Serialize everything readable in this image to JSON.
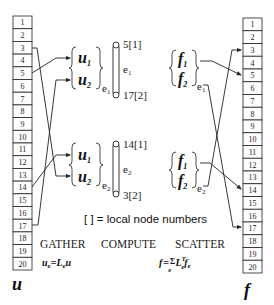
{
  "left_array": {
    "label": "u",
    "cells": [
      "1",
      "2",
      "3",
      "4",
      "5",
      "6",
      "7",
      "8",
      "9",
      "10",
      "11",
      "12",
      "13",
      "14",
      "15",
      "16",
      "17",
      "18",
      "19",
      "20"
    ]
  },
  "right_array": {
    "label": "f",
    "cells": [
      "1",
      "2",
      "3",
      "4",
      "5",
      "6",
      "7",
      "8",
      "9",
      "10",
      "11",
      "12",
      "13",
      "14",
      "15",
      "16",
      "17",
      "18",
      "19",
      "20"
    ]
  },
  "element_1": {
    "name": "e1",
    "name_main": "e",
    "name_sub": "1",
    "u_vector": {
      "u1_main": "u",
      "u1_sub": "1",
      "u2_main": "u",
      "u2_sub": "2",
      "elem_main": "e",
      "elem_sub": "1"
    },
    "f_vector": {
      "f1_main": "f",
      "f1_sub": "1",
      "f2_main": "f",
      "f2_sub": "2",
      "elem_main": "e",
      "elem_sub": "1"
    },
    "node_top": "5[1]",
    "node_bottom": "17[2]",
    "gather_map": {
      "u1": 5,
      "u2": 17
    },
    "scatter_map": {
      "f1": 5,
      "f2": 17
    }
  },
  "element_2": {
    "name": "e2",
    "name_main": "e",
    "name_sub": "2",
    "u_vector": {
      "u1_main": "u",
      "u1_sub": "1",
      "u2_main": "u",
      "u2_sub": "2",
      "elem_main": "e",
      "elem_sub": "2"
    },
    "f_vector": {
      "f1_main": "f",
      "f1_sub": "1",
      "f2_main": "f",
      "f2_sub": "2",
      "elem_main": "e",
      "elem_sub": "2"
    },
    "node_top": "14[1]",
    "node_bottom": "3[2]",
    "gather_map": {
      "u1": 14,
      "u2": 3
    },
    "scatter_map": {
      "f1": 14,
      "f2": 3
    }
  },
  "legend_note": "[ ] = local node numbers",
  "phases": {
    "gather": "GATHER",
    "compute": "COMPUTE",
    "scatter": "SCATTER"
  },
  "formulas": {
    "gather": {
      "lhs_main": "u",
      "lhs_sub": "e",
      "eq": "=",
      "op_main": "L",
      "op_sub": "e",
      "rhs": "u"
    },
    "scatter": {
      "lhs": "f",
      "eq": "=",
      "sum": "Σ",
      "sum_sub": "e",
      "op_main": "L",
      "op_sup": "T",
      "op_sub": "e",
      "rhs_main": "f",
      "rhs_sub": "e"
    }
  },
  "colors": {
    "ink": "#222222",
    "background": "#ffffff"
  }
}
